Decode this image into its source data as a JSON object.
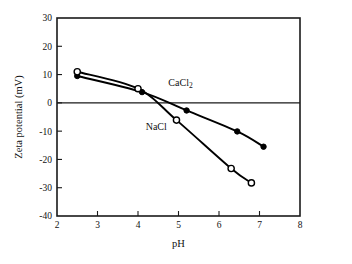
{
  "figure": {
    "background_color": "#ffffff",
    "ink_color": "#000000"
  },
  "chart_data": {
    "type": "line",
    "title": "",
    "subtitle": "",
    "xlabel": "pH",
    "ylabel": "Zeta potential (mV)",
    "xlim": [
      2,
      8
    ],
    "ylim": [
      -40,
      30
    ],
    "xticks": [
      2,
      3,
      4,
      5,
      6,
      7,
      8
    ],
    "xtick_labels": [
      "2",
      "3",
      "4",
      "5",
      "6",
      "7",
      "8"
    ],
    "yticks": [
      30,
      20,
      10,
      0,
      -10,
      -20,
      -30,
      -40
    ],
    "ytick_labels": [
      "30",
      "20",
      "10",
      "0",
      "-10",
      "-20",
      "-30",
      "-40"
    ],
    "grid": false,
    "legend_position": "inline-annotations",
    "zero_line": 0,
    "annotations": [
      {
        "text": "CaCl2",
        "display": "CaCl",
        "subscript": "2",
        "x": 5.05,
        "y": 6.0
      },
      {
        "text": "NaCl",
        "display": "NaCl",
        "subscript": "",
        "x": 4.45,
        "y": -9.5
      }
    ],
    "series": [
      {
        "name": "CaCl2",
        "display_name": "CaCl",
        "subscript": "2",
        "marker": "filled-circle",
        "marker_color": "#000000",
        "line_color": "#000000",
        "x": [
          2.5,
          4.1,
          5.2,
          6.45,
          7.1
        ],
        "y": [
          9.5,
          3.8,
          -2.7,
          -10.1,
          -15.5
        ]
      },
      {
        "name": "NaCl",
        "display_name": "NaCl",
        "subscript": "",
        "marker": "open-circle",
        "marker_color": "#000000",
        "line_color": "#000000",
        "x": [
          2.5,
          4.0,
          4.95,
          6.3,
          6.8
        ],
        "y": [
          11.0,
          5.0,
          -6.1,
          -23.2,
          -28.3
        ]
      }
    ]
  }
}
